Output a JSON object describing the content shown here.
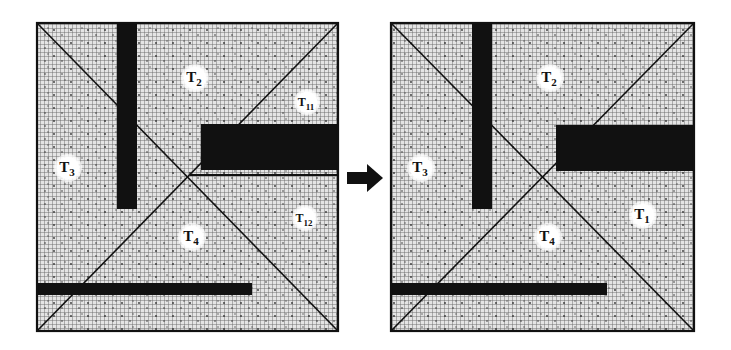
{
  "colors": {
    "background": "#ffffff",
    "grid_fill": "#d9d9d9",
    "grid_line": "#555555",
    "obstacle": "#111111",
    "label_bg": "#ffffff",
    "stroke": "#111111"
  },
  "panels": [
    {
      "id": "before",
      "labels": [
        {
          "base": "T",
          "sub": "2",
          "x": 195,
          "y": 78
        },
        {
          "base": "T",
          "sub": "3",
          "x": 68,
          "y": 168
        },
        {
          "base": "T",
          "sub": "4",
          "x": 192,
          "y": 237
        },
        {
          "base": "T",
          "sub": "11",
          "x": 307,
          "y": 102
        },
        {
          "base": "T",
          "sub": "12",
          "x": 305,
          "y": 218
        }
      ]
    },
    {
      "id": "after",
      "labels": [
        {
          "base": "T",
          "sub": "2",
          "x": 550,
          "y": 78
        },
        {
          "base": "T",
          "sub": "3",
          "x": 421,
          "y": 168
        },
        {
          "base": "T",
          "sub": "4",
          "x": 548,
          "y": 237
        },
        {
          "base": "T",
          "sub": "1",
          "x": 643,
          "y": 215
        }
      ]
    }
  ],
  "arrow": {
    "direction": "right"
  }
}
